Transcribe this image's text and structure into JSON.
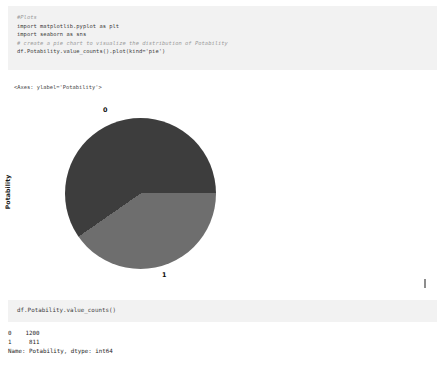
{
  "cells": [
    {
      "name": "plot-cell",
      "lines": [
        "#Plots",
        "import matplotlib.pyplot as plt",
        "import seaborn as sns",
        "",
        "# create a pie chart to visualize the distribution of Potability",
        "df.Potability.value_counts().plot(kind='pie')"
      ],
      "output_repr": "<Axes: ylabel='Potability'>"
    },
    {
      "name": "value-counts-cell",
      "lines": [
        "df.Potability.value_counts()"
      ],
      "output_lines": [
        "0    1200",
        "1     811",
        "Name: Potability, dtype: int64"
      ]
    }
  ],
  "chart_data": {
    "type": "pie",
    "title": "",
    "ylabel": "Potability",
    "xlabel": "",
    "categories": [
      "0",
      "1"
    ],
    "values": [
      1200,
      811
    ],
    "percentages": [
      59.7,
      40.3
    ],
    "total": 2011,
    "colors": [
      "#3d3d3d",
      "#6e6e6e"
    ],
    "startangle": 0,
    "counterclock": true,
    "legend": false,
    "labels_shown": [
      "0",
      "1"
    ],
    "label_positions": [
      "top",
      "bottom"
    ]
  },
  "colors": {
    "page_background": "#ffffff",
    "cell_background": "#f2f2f2",
    "code_text": "#3c3c3c",
    "comment_text": "#9a9a9a",
    "output_text": "#262626",
    "slice_0": "#3d3d3d",
    "slice_1": "#6e6e6e"
  }
}
